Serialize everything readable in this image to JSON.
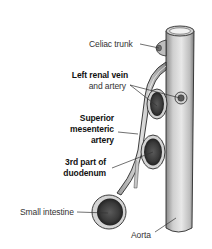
{
  "diagram": {
    "type": "anatomical-illustration",
    "labels": {
      "celiac_trunk": "Celiac trunk",
      "left_renal_vein_line1": "Left renal vein",
      "left_renal_vein_line2": "and artery",
      "sma_line1": "Superior",
      "sma_line2": "mesenteric",
      "sma_line3": "artery",
      "duodenum_line1": "3rd part of",
      "duodenum_line2": "duodenum",
      "small_intestine": "Small intestine",
      "aorta": "Aorta"
    },
    "structures": [
      {
        "name": "aorta",
        "shape": "vertical-cylinder"
      },
      {
        "name": "celiac-trunk",
        "shape": "stub-branch"
      },
      {
        "name": "superior-mesenteric-artery",
        "shape": "curved-vessel"
      },
      {
        "name": "left-renal-vein-cross-section",
        "shape": "oval"
      },
      {
        "name": "left-renal-artery-cross-section",
        "shape": "small-circle"
      },
      {
        "name": "duodenum-cross-section",
        "shape": "oval"
      },
      {
        "name": "small-intestine-cross-section",
        "shape": "circle"
      }
    ],
    "colors": {
      "vessel_light": "#e6e6e6",
      "vessel_mid": "#bdbdbd",
      "vessel_dark": "#6e6e6e",
      "outline": "#2a2a2a",
      "lumen_dark": "#3a3a3a",
      "text": "#333333"
    }
  }
}
